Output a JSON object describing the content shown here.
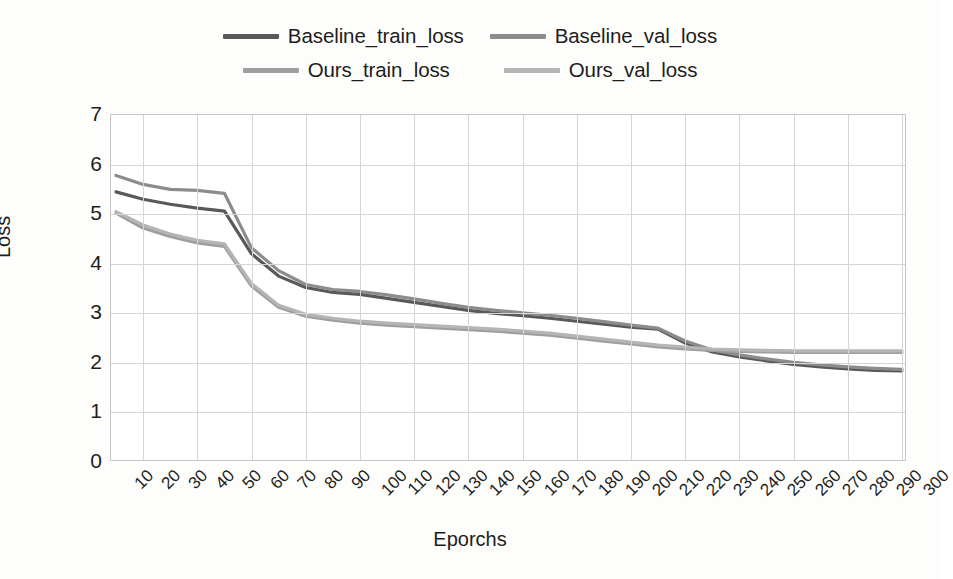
{
  "chart_data": {
    "type": "line",
    "title": "",
    "xlabel": "Eporchs",
    "ylabel": "Loss",
    "xlim": [
      10,
      300
    ],
    "ylim": [
      0,
      7
    ],
    "ytick_labels": [
      "7",
      "6",
      "5",
      "4",
      "3",
      "2",
      "1",
      "0"
    ],
    "ytick_values": [
      7,
      6,
      5,
      4,
      3,
      2,
      1,
      0
    ],
    "grid": true,
    "legend_position": "top-center",
    "x": [
      10,
      20,
      30,
      40,
      50,
      60,
      70,
      80,
      90,
      100,
      110,
      120,
      130,
      140,
      150,
      160,
      170,
      180,
      190,
      200,
      210,
      220,
      230,
      240,
      250,
      260,
      270,
      280,
      290,
      300
    ],
    "xtick_labels": [
      "10",
      "20",
      "30",
      "40",
      "50",
      "60",
      "70",
      "80",
      "90",
      "100",
      "110",
      "120",
      "130",
      "140",
      "150",
      "160",
      "170",
      "180",
      "190",
      "200",
      "210",
      "220",
      "230",
      "240",
      "250",
      "260",
      "270",
      "280",
      "290",
      "300"
    ],
    "series": [
      {
        "name": "Baseline_train_loss",
        "color": "#595959",
        "values": [
          5.45,
          5.3,
          5.2,
          5.12,
          5.06,
          4.2,
          3.75,
          3.52,
          3.42,
          3.38,
          3.3,
          3.22,
          3.14,
          3.06,
          3.0,
          2.95,
          2.9,
          2.84,
          2.78,
          2.72,
          2.68,
          2.4,
          2.22,
          2.12,
          2.04,
          1.97,
          1.92,
          1.88,
          1.85,
          1.84
        ]
      },
      {
        "name": "Baseline_val_loss",
        "color": "#8c8c8c",
        "values": [
          5.78,
          5.6,
          5.5,
          5.48,
          5.42,
          4.32,
          3.86,
          3.58,
          3.48,
          3.44,
          3.37,
          3.29,
          3.2,
          3.12,
          3.06,
          3.01,
          2.96,
          2.9,
          2.83,
          2.76,
          2.7,
          2.44,
          2.26,
          2.16,
          2.08,
          2.01,
          1.96,
          1.92,
          1.89,
          1.87
        ]
      },
      {
        "name": "Ours_train_loss",
        "color": "#9e9e9e",
        "values": [
          5.02,
          4.72,
          4.55,
          4.42,
          4.35,
          3.55,
          3.12,
          2.94,
          2.86,
          2.8,
          2.76,
          2.73,
          2.7,
          2.67,
          2.64,
          2.6,
          2.56,
          2.5,
          2.44,
          2.38,
          2.32,
          2.28,
          2.25,
          2.23,
          2.22,
          2.21,
          2.21,
          2.21,
          2.21,
          2.21
        ]
      },
      {
        "name": "Ours_val_loss",
        "color": "#b5b5b5",
        "values": [
          5.05,
          4.78,
          4.6,
          4.47,
          4.4,
          3.6,
          3.16,
          2.98,
          2.9,
          2.84,
          2.8,
          2.77,
          2.74,
          2.71,
          2.68,
          2.64,
          2.6,
          2.54,
          2.48,
          2.42,
          2.36,
          2.32,
          2.28,
          2.26,
          2.25,
          2.24,
          2.24,
          2.24,
          2.24,
          2.24
        ]
      }
    ]
  },
  "legend": {
    "rows": [
      [
        {
          "label": "Baseline_train_loss",
          "color": "#595959"
        },
        {
          "label": "Baseline_val_loss",
          "color": "#8c8c8c"
        }
      ],
      [
        {
          "label": "Ours_train_loss",
          "color": "#9e9e9e"
        },
        {
          "label": "Ours_val_loss",
          "color": "#b5b5b5"
        }
      ]
    ]
  },
  "axes": {
    "y_title": "Loss",
    "x_title": "Eporchs"
  }
}
